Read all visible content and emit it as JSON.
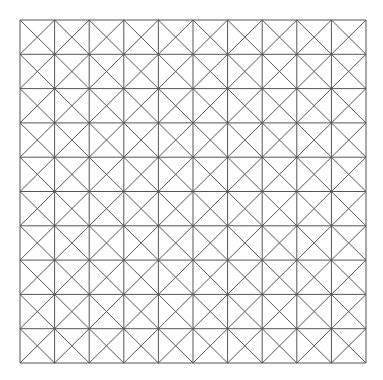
{
  "diagram": {
    "type": "triangulated-grid",
    "rows": 10,
    "cols": 10,
    "cell_diagonals": "both",
    "origin": [
      20,
      20
    ],
    "extent": [
      366,
      363
    ],
    "stroke_color": "#555555",
    "background": "#ffffff"
  }
}
